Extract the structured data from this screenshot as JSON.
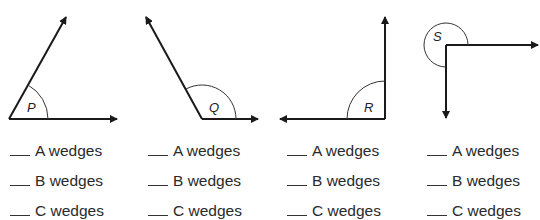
{
  "angles": [
    {
      "label": "P",
      "type": "acute"
    },
    {
      "label": "Q",
      "type": "obtuse"
    },
    {
      "label": "R",
      "type": "right"
    },
    {
      "label": "S",
      "type": "reflex"
    }
  ],
  "answers": [
    {
      "angle": "P",
      "rows": [
        {
          "blank": "___",
          "text": "A wedges"
        },
        {
          "blank": "___",
          "text": "B wedges"
        },
        {
          "blank": "___",
          "text": "C wedges"
        }
      ]
    },
    {
      "angle": "Q",
      "rows": [
        {
          "blank": "___",
          "text": "A wedges"
        },
        {
          "blank": "___",
          "text": "B wedges"
        },
        {
          "blank": "___",
          "text": "C wedges"
        }
      ]
    },
    {
      "angle": "R",
      "rows": [
        {
          "blank": "___",
          "text": "A wedges"
        },
        {
          "blank": "___",
          "text": "B wedges"
        },
        {
          "blank": "___",
          "text": "C wedges"
        }
      ]
    },
    {
      "angle": "S",
      "rows": [
        {
          "blank": "___",
          "text": "A wedges"
        },
        {
          "blank": "___",
          "text": "B wedges"
        },
        {
          "blank": "___",
          "text": "C wedges"
        }
      ]
    }
  ],
  "colors": {
    "stroke": "#1a1a1a",
    "text": "#2a2a2a",
    "background": "#ffffff"
  }
}
